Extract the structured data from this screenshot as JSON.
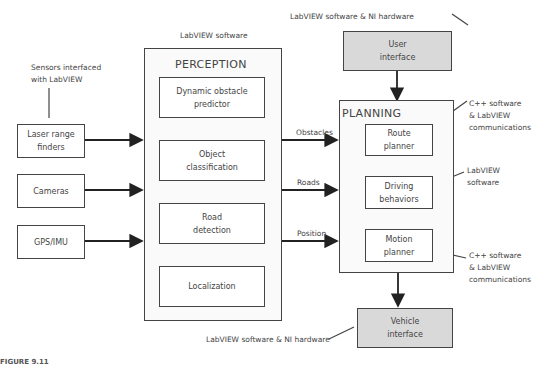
{
  "caption": "FIGURE 9.11",
  "notes": {
    "sensors": "Sensors interfaced\nwith LabVIEW",
    "perception_software": "LabVIEW software",
    "ui_hardware": "LabVIEW software & NI hardware",
    "route_comm": "C++ software\n& LabVIEW\ncommunications",
    "driving_software": "LabVIEW\nsoftware",
    "motion_comm": "C++ software\n& LabVIEW\ncommunications",
    "vehicle_hardware": "LabVIEW software & NI hardware"
  },
  "sensors": [
    {
      "label": "Laser range\nfinders"
    },
    {
      "label": "Cameras"
    },
    {
      "label": "GPS/IMU"
    }
  ],
  "perception": {
    "title": "PERCEPTION",
    "modules": [
      {
        "label": "Dynamic obstacle\npredictor"
      },
      {
        "label": "Object\nclassification"
      },
      {
        "label": "Road\ndetection"
      },
      {
        "label": "Localization"
      }
    ]
  },
  "flows": [
    {
      "label": "Obstacles"
    },
    {
      "label": "Roads"
    },
    {
      "label": "Position"
    }
  ],
  "planning": {
    "title": "PLANNING",
    "modules": [
      {
        "label": "Route\nplanner"
      },
      {
        "label": "Driving\nbehaviors"
      },
      {
        "label": "Motion\nplanner"
      }
    ]
  },
  "user_interface": {
    "label": "User\ninterface"
  },
  "vehicle_interface": {
    "label": "Vehicle\ninterface"
  },
  "colors": {
    "interface_fill": "#d9d9d9",
    "line": "#444444"
  }
}
